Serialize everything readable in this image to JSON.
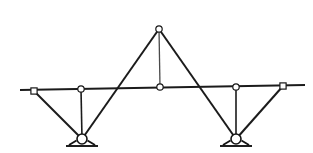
{
  "figure": {
    "width": 313,
    "height": 153,
    "background_color": "#ffffff",
    "line_color": "#1b1b1b",
    "joint_fill_color": "#ffffff"
  },
  "chart_data": {
    "type": "diagram",
    "xlabel": "",
    "ylabel": "",
    "xlim": [
      0,
      313
    ],
    "ylim": [
      0,
      153
    ],
    "grid": false,
    "legend": "none",
    "nodes": [
      {
        "id": "beam-left-end",
        "label": "beam left end",
        "x": 20,
        "y": 90,
        "marker": "none"
      },
      {
        "id": "joint-left-outer",
        "label": "left outer chord joint",
        "x": 34,
        "y": 91,
        "marker": "square-small"
      },
      {
        "id": "joint-left-hanger",
        "label": "left hanger chord joint",
        "x": 81,
        "y": 89,
        "marker": "circle-small"
      },
      {
        "id": "joint-center",
        "label": "center chord joint",
        "x": 160,
        "y": 87,
        "marker": "circle-small"
      },
      {
        "id": "joint-apex",
        "label": "apex joint",
        "x": 159,
        "y": 29,
        "marker": "circle-small"
      },
      {
        "id": "joint-right-hanger",
        "label": "right hanger chord joint",
        "x": 236,
        "y": 87,
        "marker": "circle-small"
      },
      {
        "id": "joint-right-outer",
        "label": "right outer chord joint",
        "x": 283,
        "y": 86,
        "marker": "square-small"
      },
      {
        "id": "beam-right-end",
        "label": "beam right end",
        "x": 305,
        "y": 85,
        "marker": "none"
      },
      {
        "id": "support-left",
        "label": "left pin support",
        "x": 82,
        "y": 139,
        "marker": "pin-support"
      },
      {
        "id": "support-right",
        "label": "right pin support",
        "x": 236,
        "y": 139,
        "marker": "pin-support"
      }
    ],
    "members": [
      {
        "id": "chord",
        "label": "top horizontal chord",
        "from": "beam-left-end",
        "to": "beam-right-end",
        "kind": "chord"
      },
      {
        "id": "diag-left-outer",
        "label": "left outer diagonal",
        "from": "joint-left-outer",
        "to": "support-left",
        "kind": "diagonal"
      },
      {
        "id": "hanger-left",
        "label": "left vertical hanger",
        "from": "joint-left-hanger",
        "to": "support-left",
        "kind": "hanger"
      },
      {
        "id": "diag-left-inner",
        "label": "left inner diagonal to apex",
        "from": "support-left",
        "to": "joint-apex",
        "kind": "diagonal"
      },
      {
        "id": "tie-apex",
        "label": "apex vertical tie",
        "from": "joint-apex",
        "to": "joint-center",
        "kind": "apex-tie"
      },
      {
        "id": "diag-right-inner",
        "label": "right inner diagonal to apex",
        "from": "joint-apex",
        "to": "support-right",
        "kind": "diagonal"
      },
      {
        "id": "hanger-right",
        "label": "right vertical hanger",
        "from": "joint-right-hanger",
        "to": "support-right",
        "kind": "hanger"
      },
      {
        "id": "diag-right-outer",
        "label": "right outer diagonal",
        "from": "support-right",
        "to": "joint-right-outer",
        "kind": "diagonal"
      }
    ],
    "supports": [
      {
        "id": "support-left",
        "label": "left pin support",
        "x": 82,
        "y": 139,
        "radius": 5.0,
        "ground_half_width": 16,
        "ground_offset": 7
      },
      {
        "id": "support-right",
        "label": "right pin support",
        "x": 236,
        "y": 139,
        "radius": 5.0,
        "ground_half_width": 16,
        "ground_offset": 7
      }
    ],
    "annotations": []
  }
}
